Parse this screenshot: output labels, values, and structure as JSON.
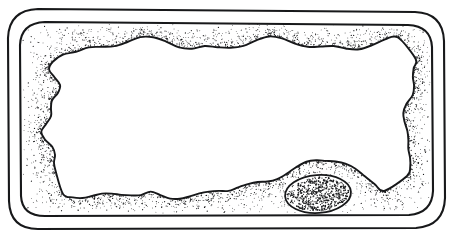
{
  "figure": {
    "domain_label": "biological-cell-diagram",
    "background_color": "#ffffff",
    "ink_color": "#17181a",
    "canvas": {
      "width": 453,
      "height": 239
    },
    "style": "pen-and-ink stipple line drawing, no text labels",
    "has_text_labels": false
  },
  "structures": [
    {
      "id": "cell-wall-outer",
      "name": "cell-wall-outer-boundary",
      "shape": "rounded-rectangle",
      "stroke_width": 2.1,
      "color": "#17181a",
      "bounds": {
        "x": 8,
        "y": 9,
        "width": 437,
        "height": 220
      },
      "corner_radius": 30,
      "path": "M 38 9 L 415 12 Q 443 13 444 41 L 445 198 Q 444 226 416 228 L 38 229 Q 10 229 9 201 L 8 38 Q 9 10 38 9 Z"
    },
    {
      "id": "cell-wall-inner",
      "name": "cell-wall-inner-boundary",
      "shape": "rounded-rectangle",
      "stroke_width": 2.1,
      "color": "#17181a",
      "bounds": {
        "x": 20,
        "y": 21,
        "width": 413,
        "height": 195
      },
      "corner_radius": 24,
      "path": "M 45 22 L 408 25 Q 431 26 432 47 L 433 191 Q 432 213 409 215 L 45 216 Q 22 216 21 196 L 20 45 Q 21 23 45 22 Z"
    },
    {
      "id": "cytoplasm-band",
      "name": "cytoplasm-stippled-band",
      "texture": "stipple",
      "dot_color": "#1b1c1e",
      "dot_count": 2600,
      "density_profile": "sparse mid-band, dense along inner membrane edge",
      "note": "band between inner cell wall and tonoplast membrane"
    },
    {
      "id": "tonoplast",
      "name": "vacuole-membrane-irregular-boundary",
      "shape": "irregular-closed-curve",
      "stroke_width": 1.9,
      "color": "#17181a",
      "approx_bounds": {
        "x": 47,
        "y": 40,
        "width": 365,
        "height": 160
      },
      "description": "wavy organic outline enclosing the central vacuole"
    },
    {
      "id": "vacuole",
      "name": "central-vacuole-interior",
      "fill": "#ffffff",
      "texture": "none",
      "description": "large empty white central vacuole"
    },
    {
      "id": "nucleus",
      "name": "nucleus-ellipse",
      "shape": "ellipse",
      "center": {
        "x": 318,
        "y": 194
      },
      "radius_x": 33,
      "radius_y": 19,
      "rotation_deg": -4,
      "stroke_width": 1.8,
      "color": "#17181a",
      "texture": "dense-stipple",
      "dot_count": 520,
      "description": "densely stippled oval nucleus embedded in cytoplasm at lower right"
    }
  ]
}
